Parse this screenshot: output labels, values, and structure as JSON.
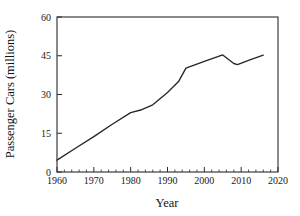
{
  "chart_data": {
    "type": "line",
    "title": "",
    "xlabel": "Year",
    "ylabel": "Passenger Cars (millions)",
    "xlim": [
      1960,
      2020
    ],
    "ylim": [
      0,
      60
    ],
    "xticks": [
      1960,
      1970,
      1980,
      1990,
      2000,
      2010,
      2020
    ],
    "xtick_labels": [
      "1960",
      "1970",
      "1980",
      "1990",
      "2000",
      "2010",
      "2020"
    ],
    "yticks": [
      0,
      15,
      30,
      45,
      60
    ],
    "ytick_labels": [
      "0",
      "15",
      "30",
      "45",
      "60"
    ],
    "x_minor_interval": 2,
    "grid": false,
    "legend": false,
    "series": [
      {
        "name": "Passenger Cars",
        "x": [
          1960,
          1965,
          1970,
          1975,
          1980,
          1983,
          1986,
          1990,
          1993,
          1995,
          2000,
          2005,
          2008,
          2009,
          2012,
          2016
        ],
        "values": [
          4.6,
          9.2,
          13.7,
          18.5,
          23.0,
          24.1,
          26.0,
          30.8,
          35.0,
          40.2,
          42.8,
          45.3,
          42.0,
          41.6,
          43.2,
          45.2
        ]
      }
    ]
  },
  "axes": {
    "x_axis_name": "Year",
    "y_axis_name": "Passenger Cars (millions)"
  }
}
